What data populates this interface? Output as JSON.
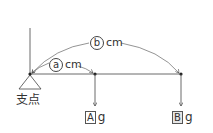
{
  "diagram": {
    "fulcrum_label": "支点",
    "distance_a": {
      "symbol": "a",
      "unit": "cm"
    },
    "distance_b": {
      "symbol": "b",
      "unit": "cm"
    },
    "weight_a": {
      "symbol": "A",
      "unit": "g"
    },
    "weight_b": {
      "symbol": "B",
      "unit": "g"
    },
    "colors": {
      "line": "#333333",
      "arc": "#666666"
    }
  }
}
